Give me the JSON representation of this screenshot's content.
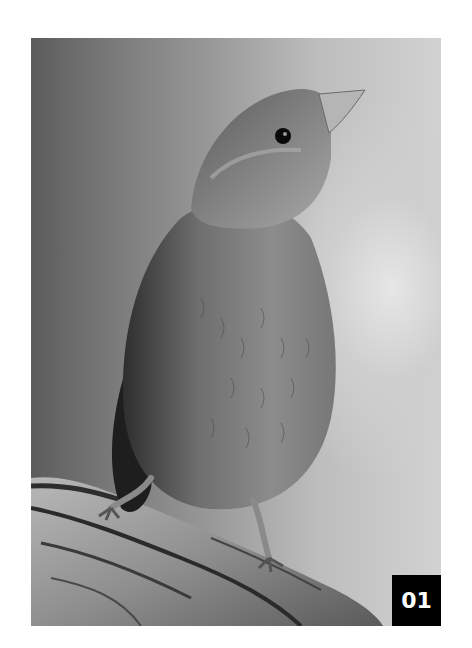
{
  "figure": {
    "label": "01",
    "colors": {
      "page_background": "#ffffff",
      "label_background": "#000000",
      "label_text": "#ffffff"
    }
  }
}
